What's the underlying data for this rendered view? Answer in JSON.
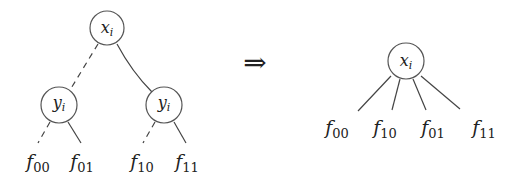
{
  "diagram": {
    "left_tree": {
      "root": {
        "label": "x",
        "sub": "i"
      },
      "children": [
        {
          "label": "y",
          "sub": "i",
          "edge_style": "dashed"
        },
        {
          "label": "y",
          "sub": "i",
          "edge_style": "solid"
        }
      ],
      "leaves": [
        {
          "label": "f",
          "sub": "00",
          "edge_style": "dashed"
        },
        {
          "label": "f",
          "sub": "01",
          "edge_style": "solid"
        },
        {
          "label": "f",
          "sub": "10",
          "edge_style": "dashed"
        },
        {
          "label": "f",
          "sub": "11",
          "edge_style": "solid"
        }
      ]
    },
    "arrow": "⇒",
    "right_tree": {
      "root": {
        "label": "x",
        "sub": "i"
      },
      "leaves": [
        {
          "label": "f",
          "sub": "00"
        },
        {
          "label": "f",
          "sub": "10"
        },
        {
          "label": "f",
          "sub": "01"
        },
        {
          "label": "f",
          "sub": "11"
        }
      ]
    }
  }
}
